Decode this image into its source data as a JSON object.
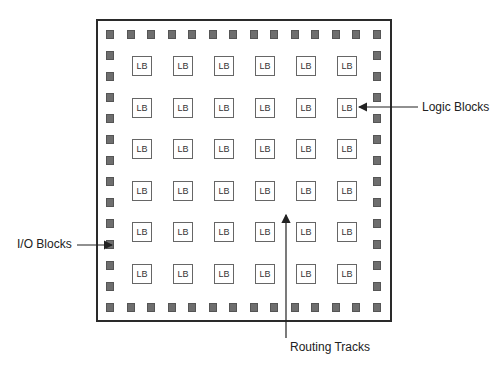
{
  "diagram": {
    "logic_block_label": "LB",
    "grid": {
      "rows": 6,
      "cols": 6
    },
    "io_pads": {
      "top": 14,
      "bottom": 14,
      "left": 12,
      "right": 12
    },
    "colors": {
      "io_pad": "#6e6e6e",
      "border": "#2a2a2a",
      "logic_block_border": "#666666"
    }
  },
  "annotations": {
    "logic_blocks": "Logic Blocks",
    "io_blocks": "I/O Blocks",
    "routing_tracks": "Routing Tracks"
  }
}
